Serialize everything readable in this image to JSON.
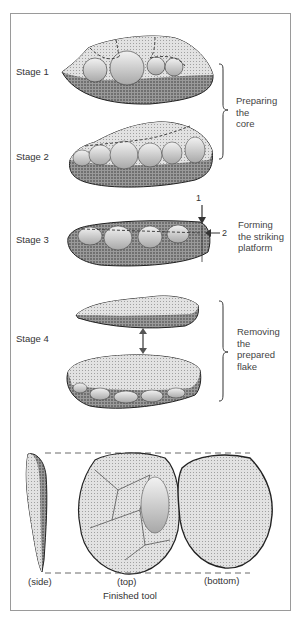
{
  "diagram": {
    "stages": [
      {
        "label": "Stage 1"
      },
      {
        "label": "Stage 2"
      },
      {
        "label": "Stage 3"
      },
      {
        "label": "Stage 4"
      }
    ],
    "groups": [
      {
        "lines": [
          "Preparing",
          "the",
          "core"
        ]
      },
      {
        "lines": [
          "Forming",
          "the striking",
          "platform"
        ]
      },
      {
        "lines": [
          "Removing",
          "the",
          "prepared",
          "flake"
        ]
      }
    ],
    "arrows": {
      "arrow_1": "1",
      "arrow_2": "2"
    },
    "views": {
      "side": "(side)",
      "top": "(top)",
      "bottom": "(bottom)"
    },
    "caption": "Finished tool",
    "colors": {
      "ink": "#2a2a2a",
      "stipple_dark": "#6b6b6b",
      "stipple_light": "#bdbdbd",
      "frame": "#9a9a9a"
    }
  }
}
